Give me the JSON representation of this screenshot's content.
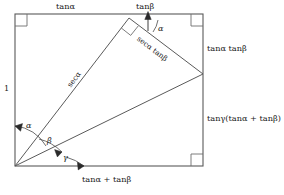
{
  "figure": {
    "type": "geometry-proof-diagram",
    "stroke_color": "#5a5a5a",
    "text_color": "#1a1a1a",
    "background": "#ffffff",
    "rectangle": {
      "left": 15,
      "top": 14,
      "right": 203,
      "bottom": 166,
      "right_angle_corners": [
        "top-left",
        "top-right",
        "bottom-right"
      ]
    },
    "vertices": {
      "origin": [
        15,
        166
      ],
      "apex": [
        129,
        18
      ],
      "right_point": [
        203,
        74
      ],
      "top_left": [
        15,
        14
      ],
      "top_right": [
        203,
        14
      ],
      "bottom_right": [
        203,
        166
      ]
    }
  },
  "labels": {
    "top_left_side": "tanα",
    "top_right_arrow": "tanβ",
    "left_side": "1",
    "right_upper": "tanα tanβ",
    "right_lower": "tanγ(tanα + tanβ)",
    "bottom": "tanα + tanβ",
    "hypotenuse_lower": "secα",
    "hypotenuse_upper": "secα tanβ",
    "angle_alpha_origin": "α",
    "angle_beta_origin": "β",
    "angle_gamma_origin": "γ",
    "angle_alpha_apex": "α"
  }
}
